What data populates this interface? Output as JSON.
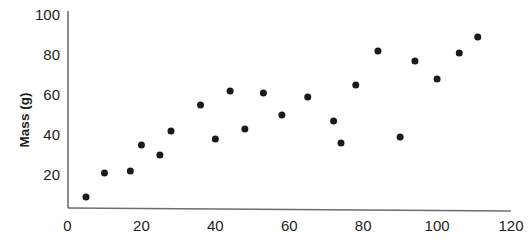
{
  "chart_data": {
    "type": "scatter",
    "title": "",
    "xlabel": "",
    "ylabel": "Mass (g)",
    "xlim": [
      0,
      120
    ],
    "ylim": [
      0,
      100
    ],
    "xticks": [
      0,
      20,
      40,
      60,
      80,
      100,
      120
    ],
    "yticks": [
      20,
      40,
      60,
      80,
      100
    ],
    "xtick_labels": [
      "0",
      "20",
      "40",
      "60",
      "80",
      "100",
      "120"
    ],
    "ytick_labels": [
      "20",
      "40",
      "60",
      "80",
      "100"
    ],
    "grid": false,
    "legend": false,
    "marker": {
      "shape": "circle",
      "color": "#1a1a1a",
      "size_px": 7
    },
    "axis_color": "#6d6e71",
    "points": [
      {
        "x": 5,
        "y": 9
      },
      {
        "x": 10,
        "y": 21
      },
      {
        "x": 17,
        "y": 22
      },
      {
        "x": 20,
        "y": 35
      },
      {
        "x": 25,
        "y": 30
      },
      {
        "x": 28,
        "y": 42
      },
      {
        "x": 36,
        "y": 55
      },
      {
        "x": 40,
        "y": 38
      },
      {
        "x": 44,
        "y": 62
      },
      {
        "x": 48,
        "y": 43
      },
      {
        "x": 53,
        "y": 61
      },
      {
        "x": 58,
        "y": 50
      },
      {
        "x": 65,
        "y": 59
      },
      {
        "x": 72,
        "y": 47
      },
      {
        "x": 74,
        "y": 36
      },
      {
        "x": 78,
        "y": 65
      },
      {
        "x": 84,
        "y": 82
      },
      {
        "x": 90,
        "y": 39
      },
      {
        "x": 94,
        "y": 77
      },
      {
        "x": 100,
        "y": 68
      },
      {
        "x": 106,
        "y": 81
      },
      {
        "x": 111,
        "y": 89
      }
    ]
  }
}
